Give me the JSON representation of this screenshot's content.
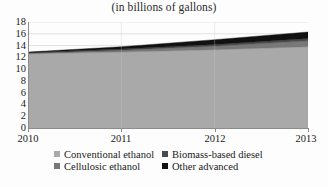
{
  "chart_data": {
    "type": "area",
    "stacked": true,
    "title": "(in billions of gallons)",
    "xlabel": "",
    "ylabel": "",
    "categories": [
      "2010",
      "2011",
      "2012",
      "2013"
    ],
    "x": [
      2010,
      2011,
      2012,
      2013
    ],
    "xlim": [
      2010,
      2013
    ],
    "ylim": [
      0,
      18
    ],
    "yticks": [
      0,
      2,
      4,
      6,
      8,
      10,
      12,
      14,
      16,
      18
    ],
    "xticks": [
      "2010",
      "2011",
      "2012",
      "2013"
    ],
    "grid": true,
    "legend_position": "bottom",
    "series": [
      {
        "name": "Conventional ethanol",
        "color": "#a9a9a9",
        "values": [
          12.6,
          12.9,
          13.3,
          13.8
        ]
      },
      {
        "name": "Cellulosic ethanol",
        "color": "#787878",
        "values": [
          0.1,
          0.3,
          0.6,
          1.0
        ]
      },
      {
        "name": "Biomass-based diesel",
        "color": "#4a4a4a",
        "values": [
          0.1,
          0.2,
          0.3,
          0.4
        ]
      },
      {
        "name": "Other advanced",
        "color": "#111111",
        "values": [
          0.1,
          0.4,
          0.8,
          1.1
        ]
      }
    ],
    "totals": [
      12.9,
      13.8,
      15.0,
      16.3
    ]
  },
  "legend": {
    "items": [
      {
        "label": "Conventional ethanol",
        "swatch": "#a9a9a9"
      },
      {
        "label": "Biomass-based diesel",
        "swatch": "#4a4a4a"
      },
      {
        "label": "Cellulosic ethanol",
        "swatch": "#787878"
      },
      {
        "label": "Other advanced",
        "swatch": "#111111"
      }
    ]
  },
  "axes": {
    "y_labels": [
      "18",
      "16",
      "14",
      "12",
      "10",
      "8",
      "6",
      "4",
      "2",
      "0"
    ],
    "x_labels": [
      "2010",
      "2011",
      "2012",
      "2013"
    ]
  },
  "colors": {
    "plot_background": "#fdfdfd",
    "grid": "#d8d8d8",
    "axis": "#8c8c8c",
    "text": "#1a1a1a"
  }
}
